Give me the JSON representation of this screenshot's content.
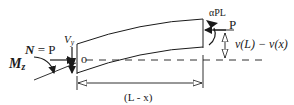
{
  "diagram": {
    "type": "beam free-body diagram",
    "labels": {
      "normal_force_symbol": "N",
      "normal_force_eq": " = P",
      "moment_symbol": "M",
      "moment_sub": "z",
      "shear_symbol": "V",
      "shear_sub": "y",
      "origin": "o",
      "end_moment": "αPL",
      "end_load": "P",
      "deflection": "v(L) − v(x)",
      "length": "(L - x)"
    },
    "colors": {
      "stroke": "#1a1a1a",
      "background": "#ffffff"
    }
  }
}
